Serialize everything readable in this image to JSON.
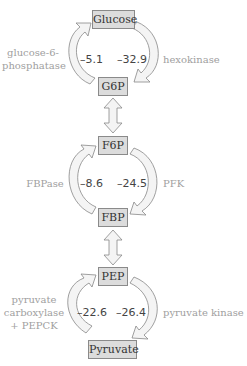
{
  "diagram": {
    "type": "metabolic-pathway",
    "metabolites": [
      "Glucose",
      "G6P",
      "F6P",
      "FBP",
      "PEP",
      "Pyruvate"
    ],
    "cycles": [
      {
        "top": "Glucose",
        "bottom": "G6P",
        "left_enzyme": "glucose-6-\nphosphatase",
        "left_enzyme_lines": [
          "glucose-6-",
          "phosphatase"
        ],
        "left_value": "–5.1",
        "right_value": "–32.9",
        "right_enzyme": "hexokinase"
      },
      {
        "top": "F6P",
        "bottom": "FBP",
        "left_enzyme_lines": [
          "FBPase"
        ],
        "left_value": "–8.6",
        "right_value": "–24.5",
        "right_enzyme": "PFK"
      },
      {
        "top": "PEP",
        "bottom": "Pyruvate",
        "left_enzyme_lines": [
          "pyruvate",
          "carboxylase",
          "+ PEPCK"
        ],
        "left_value": "–22.6",
        "right_value": "–26.4",
        "right_enzyme": "pyruvate kinase"
      }
    ],
    "reversible_links": [
      {
        "from": "G6P",
        "to": "F6P"
      },
      {
        "from": "FBP",
        "to": "PEP"
      }
    ]
  },
  "colors": {
    "box_fill": "#dcdcdc",
    "box_border": "#8a8a8a",
    "arrow_fill": "#f4f4f4",
    "arrow_stroke": "#888888",
    "enzyme_text": "#a0a0a0",
    "value_text": "#444444"
  }
}
